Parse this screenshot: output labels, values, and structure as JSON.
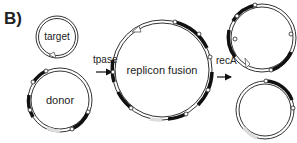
{
  "panel_label": "B)",
  "plasmids": {
    "target": {
      "label": "target"
    },
    "donor": {
      "label": "donor"
    },
    "fusion": {
      "label": "replicon fusion"
    }
  },
  "steps": {
    "tpase": {
      "label": "tpase"
    },
    "recA": {
      "label": "recA"
    }
  },
  "colors": {
    "line": "#333333",
    "fill_black": "#111111",
    "fill_white": "#ffffff",
    "fill_grey": "#dddddd"
  }
}
